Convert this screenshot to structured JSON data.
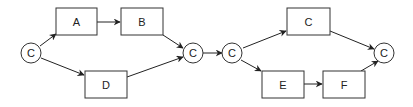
{
  "diagram": {
    "colors": {
      "stroke": "#333333",
      "background": "#ffffff",
      "text": "#222222"
    },
    "nodes": [
      {
        "id": "c1",
        "shape": "circle",
        "label": "C"
      },
      {
        "id": "a",
        "shape": "box",
        "label": "A"
      },
      {
        "id": "b",
        "shape": "box",
        "label": "B"
      },
      {
        "id": "d",
        "shape": "box",
        "label": "D"
      },
      {
        "id": "c2",
        "shape": "circle",
        "label": "C"
      },
      {
        "id": "c3",
        "shape": "circle",
        "label": "C"
      },
      {
        "id": "c4",
        "shape": "box",
        "label": "C"
      },
      {
        "id": "e",
        "shape": "box",
        "label": "E"
      },
      {
        "id": "f",
        "shape": "box",
        "label": "F"
      },
      {
        "id": "c5",
        "shape": "circle",
        "label": "C"
      }
    ],
    "edges": [
      {
        "from": "c1",
        "to": "a"
      },
      {
        "from": "a",
        "to": "b"
      },
      {
        "from": "b",
        "to": "c2"
      },
      {
        "from": "c1",
        "to": "d"
      },
      {
        "from": "d",
        "to": "c2"
      },
      {
        "from": "c2",
        "to": "c3"
      },
      {
        "from": "c3",
        "to": "c4"
      },
      {
        "from": "c4",
        "to": "c5"
      },
      {
        "from": "c3",
        "to": "e"
      },
      {
        "from": "e",
        "to": "f"
      },
      {
        "from": "f",
        "to": "c5"
      }
    ]
  }
}
